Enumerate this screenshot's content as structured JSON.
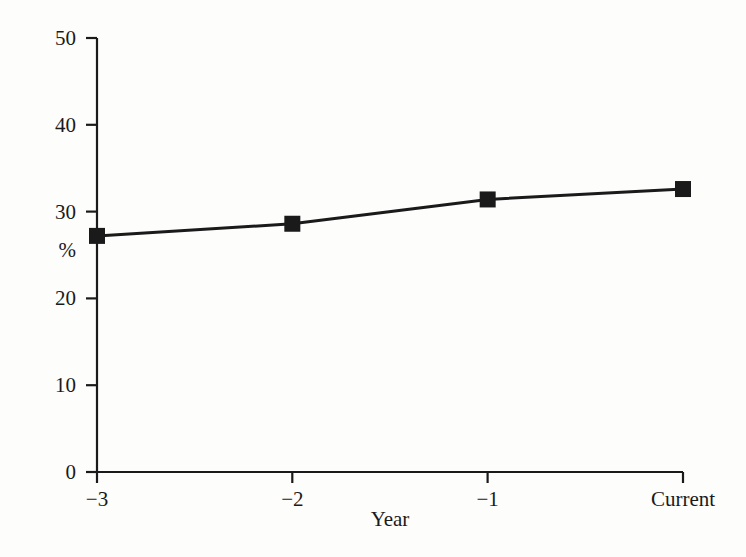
{
  "chart_data": {
    "type": "line",
    "title": "",
    "xlabel": "Year",
    "ylabel": "%",
    "categories": [
      "−3",
      "−2",
      "−1",
      "Current"
    ],
    "values": [
      27.2,
      28.6,
      31.4,
      32.6
    ],
    "series": [
      {
        "name": "",
        "values": [
          27.2,
          28.6,
          31.4,
          32.6
        ]
      }
    ],
    "ylim": [
      0,
      50
    ],
    "ytick_labels": [
      "0",
      "10",
      "20",
      "30",
      "40",
      "50"
    ],
    "ytick_values": [
      0,
      10,
      20,
      30,
      40,
      50
    ],
    "xtick_labels": [
      "−3",
      "−2",
      "−1",
      "Current"
    ],
    "grid": false,
    "legend": false,
    "marker": "filled-square",
    "line_color": "#1a1a1a",
    "marker_color": "#1a1a1a",
    "background_color": "#fdfdfc"
  }
}
